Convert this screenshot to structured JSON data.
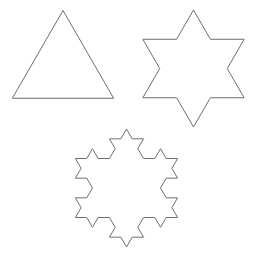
{
  "figure": {
    "stroke_color": "#6e6e6e",
    "background": "#ffffff",
    "shapes": [
      {
        "name": "koch-level-0",
        "level": 0,
        "cx": 63,
        "cy": 69,
        "r": 58.5
      },
      {
        "name": "koch-level-1",
        "level": 1,
        "cx": 193.5,
        "cy": 68.5,
        "r": 58.5
      },
      {
        "name": "koch-level-2",
        "level": 2,
        "cx": 126.5,
        "cy": 188,
        "r": 59
      }
    ]
  }
}
